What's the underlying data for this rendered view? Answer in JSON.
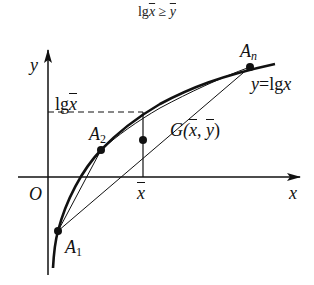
{
  "title": {
    "text_lg": "lg",
    "text_x": "x",
    "text_geq": " ≥ ",
    "text_y": "y"
  },
  "axes": {
    "x_label": "x",
    "y_label": "y",
    "origin_label": "O"
  },
  "labels": {
    "lgxbar_prefix": "lg",
    "lgxbar_var": "x",
    "xbar": "x",
    "A1_base": "A",
    "A1_sub": "1",
    "A2_base": "A",
    "A2_sub": "2",
    "An_base": "A",
    "An_sub": "n",
    "curve_y": "y",
    "curve_eq": "=lg",
    "curve_x": "x",
    "G_prefix": "G(",
    "G_x": "x",
    "G_sep": ", ",
    "G_y": "y",
    "G_suffix": ")"
  },
  "colors": {
    "stroke": "#111111",
    "background": "#ffffff"
  }
}
